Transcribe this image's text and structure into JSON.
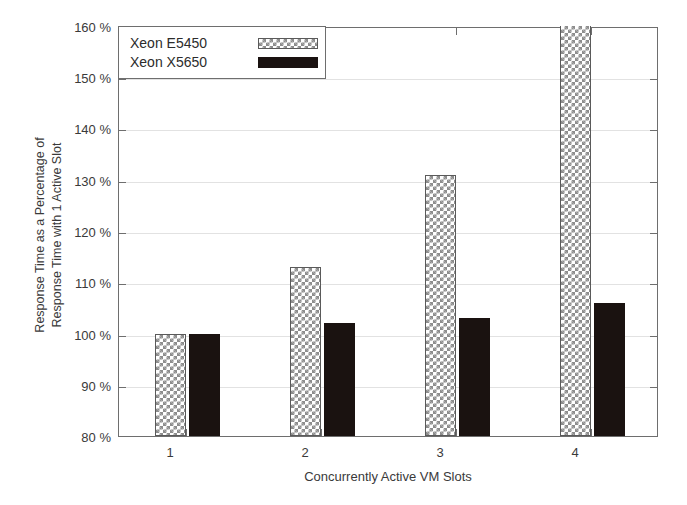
{
  "chart_data": {
    "type": "bar",
    "title": "",
    "subtitle": "",
    "xlabel": "Concurrently Active VM Slots",
    "ylabel": "Response Time as a Percentage of Response Time with 1 Active Slot",
    "ylabel_lines": [
      "Response Time as a Percentage of",
      "Response Time with 1 Active Slot"
    ],
    "categories": [
      "1",
      "2",
      "3",
      "4"
    ],
    "series": [
      {
        "name": "Xeon E5450",
        "pattern": "cross-hatch",
        "color": "#8d8d8d",
        "values": [
          100,
          113,
          131,
          160
        ]
      },
      {
        "name": "Xeon X5650",
        "pattern": "solid",
        "color": "#1a1210",
        "values": [
          100,
          102,
          103,
          106
        ]
      }
    ],
    "ylim": [
      80,
      160
    ],
    "ytick_step": 10,
    "ytick_labels": [
      "160 %",
      "150 %",
      "140 %",
      "130 %",
      "120 %",
      "110 %",
      "100 %",
      "90 %",
      "80 %"
    ],
    "ytick_values": [
      160,
      150,
      140,
      130,
      120,
      110,
      100,
      90,
      80
    ],
    "xtick_labels": [
      "1",
      "2",
      "3",
      "4"
    ],
    "grid": true,
    "grid_axis": "y",
    "legend_position": "top-left"
  }
}
